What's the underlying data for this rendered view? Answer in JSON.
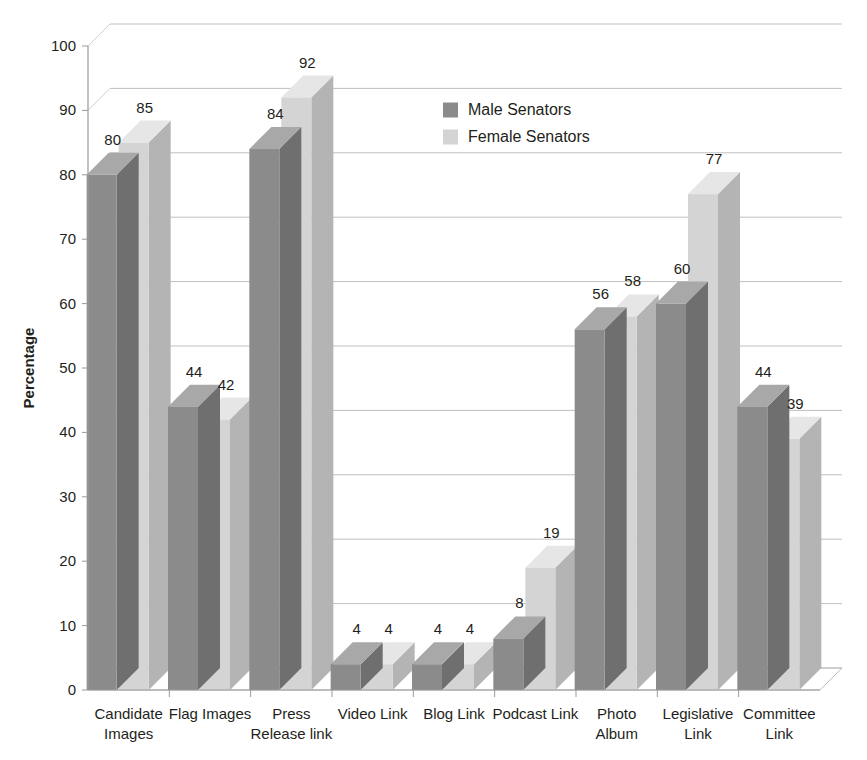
{
  "chart_data": {
    "type": "bar",
    "title": "",
    "subtitle": "",
    "xlabel": "",
    "ylabel": "Percentage",
    "ylim": [
      0,
      100
    ],
    "ytick_step": 10,
    "yticks": [
      "0",
      "10",
      "20",
      "30",
      "40",
      "50",
      "60",
      "70",
      "80",
      "90",
      "100"
    ],
    "grid": true,
    "three_d": true,
    "legend_position": "top-center",
    "categories": [
      "Candidate Images",
      "Flag Images",
      "Press Release link",
      "Video Link",
      "Blog Link",
      "Podcast Link",
      "Photo Album",
      "Legislative Link",
      "Committee Link"
    ],
    "category_lines": [
      [
        "Candidate",
        "Images"
      ],
      [
        "Flag Images"
      ],
      [
        "Press",
        "Release link"
      ],
      [
        "Video Link"
      ],
      [
        "Blog Link"
      ],
      [
        "Podcast Link"
      ],
      [
        "Photo",
        "Album"
      ],
      [
        "Legislative",
        "Link"
      ],
      [
        "Committee",
        "Link"
      ]
    ],
    "series": [
      {
        "name": "Male Senators",
        "color": "#8b8b8b",
        "color_top": "#a8a8a8",
        "color_side": "#6f6f6f",
        "values": [
          80,
          44,
          84,
          4,
          4,
          8,
          56,
          60,
          44
        ]
      },
      {
        "name": "Female Senators",
        "color": "#d4d4d4",
        "color_top": "#e6e6e6",
        "color_side": "#b4b4b4",
        "values": [
          85,
          42,
          92,
          4,
          4,
          19,
          58,
          77,
          39
        ]
      }
    ]
  },
  "legend": {
    "entries": [
      {
        "label": "Male Senators",
        "swatch": "#8b8b8b"
      },
      {
        "label": "Female Senators",
        "swatch": "#d4d4d4"
      }
    ]
  },
  "axis": {
    "y_title": "Percentage"
  },
  "colors": {
    "background": "#ffffff",
    "grid": "#bfbfbf",
    "axis": "#9a9a9a",
    "text": "#231f20",
    "male": "#8b8b8b",
    "female": "#d4d4d4"
  }
}
